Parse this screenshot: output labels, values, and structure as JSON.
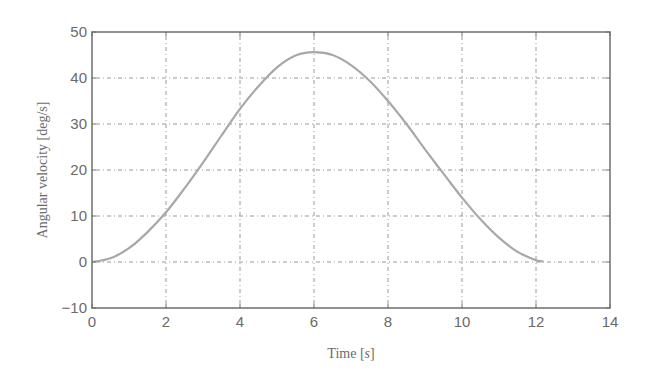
{
  "chart_data": {
    "type": "line",
    "title": "",
    "xlabel": "Time [s]",
    "xlabel_parts": {
      "prefix": "Time [",
      "var": "s",
      "suffix": "]"
    },
    "ylabel": "Angular velocity [deg/s]",
    "xlim": [
      0,
      14
    ],
    "ylim": [
      -10,
      50
    ],
    "xticks": [
      0,
      2,
      4,
      6,
      8,
      10,
      12,
      14
    ],
    "yticks": [
      -10,
      0,
      10,
      20,
      30,
      40,
      50
    ],
    "ytick_labels": [
      "−10",
      "0",
      "10",
      "20",
      "30",
      "40",
      "50"
    ],
    "grid": true,
    "legend": null,
    "series": [
      {
        "name": "Angular velocity",
        "color": "#a8a8a8",
        "x": [
          0,
          0.5,
          1,
          1.5,
          2,
          2.5,
          3,
          3.5,
          4,
          4.5,
          5,
          5.5,
          6,
          6.5,
          7,
          7.5,
          8,
          8.5,
          9,
          9.5,
          10,
          10.5,
          11,
          11.5,
          12,
          12.2
        ],
        "y": [
          0,
          0.8,
          3.0,
          6.5,
          10.8,
          16.0,
          21.6,
          27.5,
          33.3,
          38.2,
          42.3,
          44.9,
          45.6,
          45.0,
          42.8,
          39.4,
          35.0,
          30.0,
          24.5,
          19.2,
          14.0,
          9.3,
          5.3,
          2.2,
          0.4,
          0.1
        ]
      }
    ]
  },
  "colors": {
    "frame": "#6e6e6e",
    "grid": "#9a9a9a",
    "text": "#6a6a6a",
    "curve": "#a8a8a8"
  }
}
